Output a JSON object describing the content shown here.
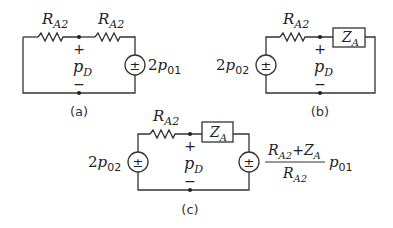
{
  "diagram": {
    "type": "equivalent-circuit-figure",
    "panels": [
      {
        "id": "a",
        "caption": "(a)",
        "components": [
          {
            "type": "resistor",
            "label_main": "R",
            "label_sub": "A2"
          },
          {
            "type": "resistor",
            "label_main": "R",
            "label_sub": "A2"
          },
          {
            "type": "voltage-source",
            "symbol": "±",
            "label_coef": "2",
            "label_main": "p",
            "label_sub": "01"
          }
        ],
        "measure": {
          "plus": "+",
          "minus": "−",
          "label_main": "p",
          "label_sub": "D"
        }
      },
      {
        "id": "b",
        "caption": "(b)",
        "components": [
          {
            "type": "voltage-source",
            "symbol": "±",
            "label_coef": "2",
            "label_main": "p",
            "label_sub": "02"
          },
          {
            "type": "resistor",
            "label_main": "R",
            "label_sub": "A2"
          },
          {
            "type": "impedance",
            "label_main": "Z",
            "label_sub": "A"
          }
        ],
        "measure": {
          "plus": "+",
          "minus": "−",
          "label_main": "p",
          "label_sub": "D"
        }
      },
      {
        "id": "c",
        "caption": "(c)",
        "components": [
          {
            "type": "voltage-source",
            "symbol": "±",
            "label_coef": "2",
            "label_main": "p",
            "label_sub": "02"
          },
          {
            "type": "resistor",
            "label_main": "R",
            "label_sub": "A2"
          },
          {
            "type": "impedance",
            "label_main": "Z",
            "label_sub": "A"
          },
          {
            "type": "voltage-source",
            "symbol": "±",
            "fraction": {
              "num_r": "R",
              "num_r_sub": "A2",
              "num_plus": "+",
              "num_z": "Z",
              "num_z_sub": "A",
              "den_r": "R",
              "den_r_sub": "A2"
            },
            "label_main": "p",
            "label_sub": "01"
          }
        ],
        "measure": {
          "plus": "+",
          "minus": "−",
          "label_main": "p",
          "label_sub": "D"
        }
      }
    ]
  }
}
